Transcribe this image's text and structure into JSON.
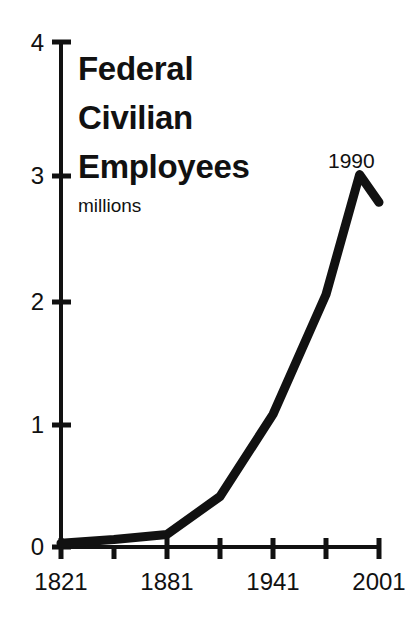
{
  "chart_data": {
    "type": "line",
    "title": "Federal Civilian Employees",
    "title_lines": [
      "Federal",
      "Civilian",
      "Employees"
    ],
    "subtitle": "millions",
    "xlabel": "",
    "ylabel": "millions",
    "xlim": [
      1821,
      2001
    ],
    "ylim": [
      0,
      4
    ],
    "grid": false,
    "legend": null,
    "y_ticks": [
      0,
      1,
      2,
      3,
      4
    ],
    "y_tick_labels": [
      "0",
      "1",
      "2",
      "3",
      "4"
    ],
    "x_ticks": [
      1821,
      1851,
      1881,
      1911,
      1941,
      1971,
      2001
    ],
    "x_tick_labels": [
      "1821",
      "",
      "1881",
      "",
      "1941",
      "",
      "2001"
    ],
    "x_labeled_ticks": [
      "1821",
      "1881",
      "1941",
      "2001"
    ],
    "line_color": "#111111",
    "line_width": 9,
    "x": [
      1821,
      1851,
      1881,
      1911,
      1941,
      1971,
      1990,
      2001
    ],
    "values": [
      0.03,
      0.06,
      0.1,
      0.4,
      1.05,
      2.0,
      2.95,
      2.73
    ],
    "series": [
      {
        "name": "Federal Civilian Employees",
        "points": [
          {
            "year": 1821,
            "value": 0.03
          },
          {
            "year": 1851,
            "value": 0.06
          },
          {
            "year": 1881,
            "value": 0.1
          },
          {
            "year": 1911,
            "value": 0.4
          },
          {
            "year": 1941,
            "value": 1.05
          },
          {
            "year": 1971,
            "value": 2.0
          },
          {
            "year": 1990,
            "value": 2.95
          },
          {
            "year": 2001,
            "value": 2.73
          }
        ]
      }
    ],
    "annotations": [
      {
        "label": "1990",
        "year": 1990,
        "value": 2.95
      }
    ]
  },
  "axis": {
    "y_labels": [
      "4",
      "3",
      "2",
      "1",
      "0"
    ],
    "x_labels": [
      "1821",
      "1881",
      "1941",
      "2001"
    ]
  },
  "annotation": {
    "peak_label": "1990"
  }
}
